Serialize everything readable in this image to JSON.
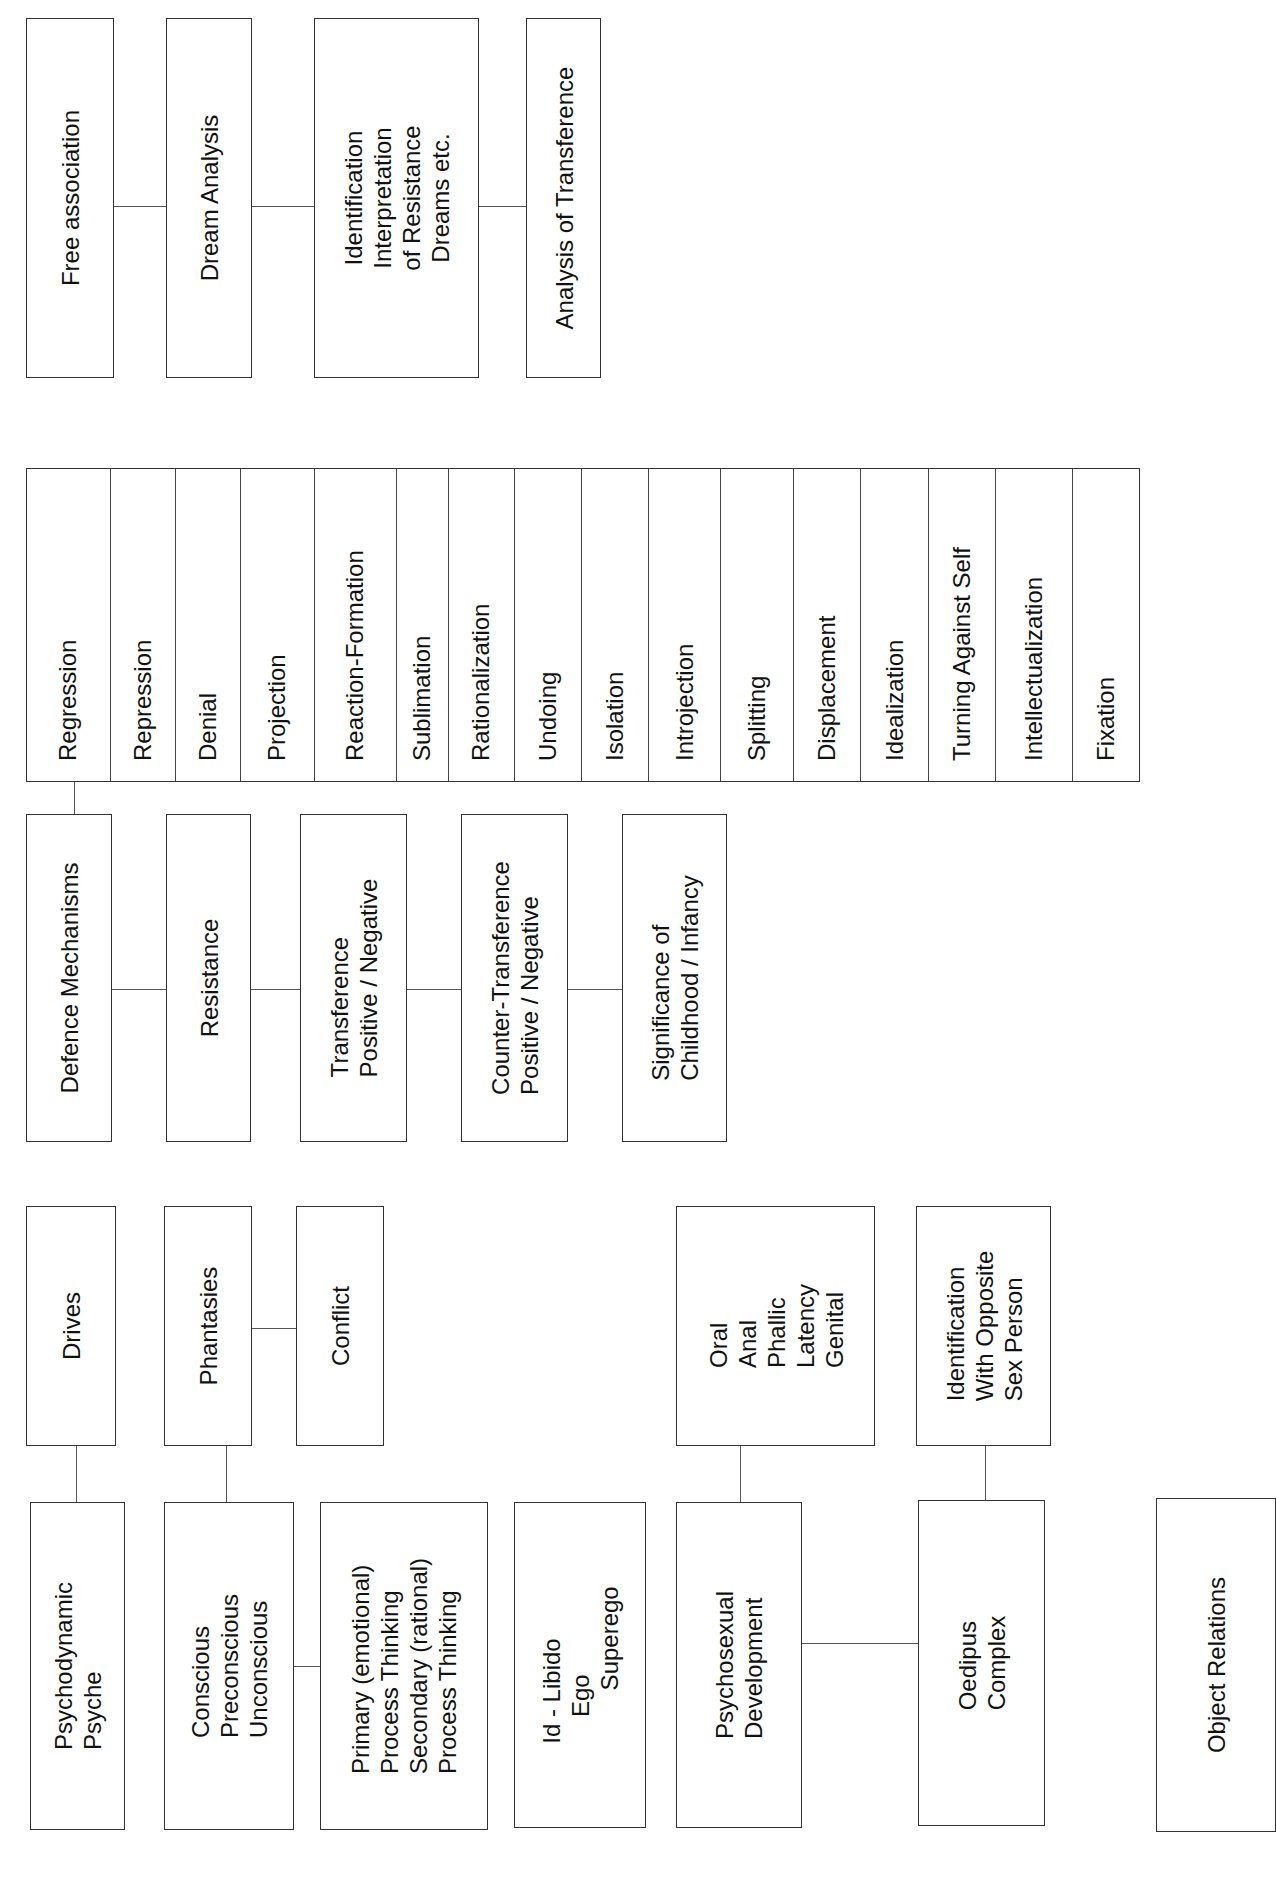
{
  "techniques": {
    "boxes": [
      {
        "id": "free-association",
        "label": "Free association"
      },
      {
        "id": "dream-analysis",
        "label": "Dream Analysis"
      },
      {
        "id": "identification-interpretation",
        "label": "Identification\nInterpretation\nof Resistance\nDreams etc."
      },
      {
        "id": "analysis-of-transference",
        "label": "Analysis of Transference"
      }
    ]
  },
  "defence_mechanisms_list": [
    "Regression",
    "Repression",
    "Denial",
    "Projection",
    "Reaction-Formation",
    "Sublimation",
    "Rationalization",
    "Undoing",
    "Isolation",
    "Introjection",
    "Splitting",
    "Displacement",
    "Idealization",
    "Turning Against Self",
    "Intellectualization",
    "Fixation"
  ],
  "concepts": {
    "boxes": [
      {
        "id": "defence-mechanisms",
        "label": "Defence Mechanisms"
      },
      {
        "id": "resistance",
        "label": "Resistance"
      },
      {
        "id": "transference",
        "label": "Transference\nPositive / Negative"
      },
      {
        "id": "counter-transference",
        "label": "Counter-Transference\nPositive / Negative"
      },
      {
        "id": "significance-childhood",
        "label": "Significance of\nChildhood / Infancy"
      }
    ]
  },
  "theory": {
    "drives": "Drives",
    "phantasies": "Phantasies",
    "conflict": "Conflict",
    "psychodynamic_psyche": "Psychodynamic\nPsyche",
    "levels_of_consciousness": "Conscious\nPreconscious\nUnconscious",
    "process_thinking": "Primary (emotional)\nProcess Thinking\nSecondary (rational)\nProcess Thinking",
    "structure": "Id - Libido\n    Ego\n        Superego",
    "psychosexual_stages": "Oral\nAnal\nPhallic\nLatency\nGenital",
    "psychosexual_development": "Psychosexual\nDevelopment",
    "identification_opposite_sex": "Identification\nWith Opposite\nSex Person",
    "oedipus_complex": "Oedipus\nComplex",
    "object_relations": "Object Relations"
  }
}
